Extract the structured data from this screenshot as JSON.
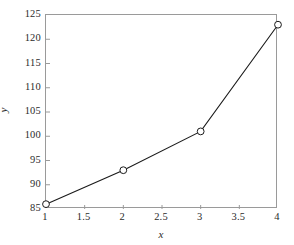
{
  "chart_data": {
    "type": "line",
    "title": "",
    "xlabel": "x",
    "ylabel": "y",
    "xlim": [
      1,
      4
    ],
    "ylim": [
      85,
      125
    ],
    "grid": false,
    "legend": false,
    "marker": "open-circle",
    "line_color": "#1a1a1a",
    "marker_edge_color": "#1a1a1a",
    "marker_face_color": "#ffffff",
    "axis_color": "#9a9a9a",
    "x": [
      1,
      2,
      3,
      4
    ],
    "values": [
      86,
      93,
      101,
      123
    ],
    "points": [
      {
        "x": 1,
        "y": 86
      },
      {
        "x": 2,
        "y": 93
      },
      {
        "x": 3,
        "y": 101
      },
      {
        "x": 4,
        "y": 123
      }
    ],
    "xticks": [
      1,
      1.5,
      2,
      2.5,
      3,
      3.5,
      4
    ],
    "xticklabels": [
      "1",
      "1.5",
      "2",
      "2.5",
      "3",
      "3.5",
      "4"
    ],
    "yticks": [
      85,
      90,
      95,
      100,
      105,
      110,
      115,
      120,
      125
    ],
    "yticklabels": [
      "85",
      "90",
      "95",
      "100",
      "105",
      "110",
      "115",
      "120",
      "125"
    ],
    "tick_direction": "in"
  }
}
